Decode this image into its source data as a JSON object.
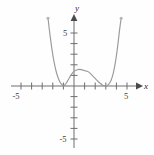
{
  "figure": {
    "background_color": "#fefefe",
    "axis_color": "#6e6e6e",
    "curve_color": "#9a9a9a",
    "label_color": "#3d3d3d"
  },
  "labels": {
    "x_axis_name": "x",
    "y_axis_name": "y",
    "x_neg_five": "-5",
    "x_pos_five": "5",
    "y_pos_five": "5",
    "y_neg_five": "-5"
  },
  "chart_data": {
    "type": "line",
    "title": "",
    "subtitle": "",
    "xlabel": "x",
    "ylabel": "y",
    "xlim": [
      -5.9,
      6.4
    ],
    "ylim": [
      -6.6,
      6.6
    ],
    "grid": false,
    "legend": null,
    "xticks": [
      -5,
      -4,
      -3,
      -2,
      -1,
      0,
      1,
      2,
      3,
      4,
      5
    ],
    "xtick_labels": [
      "-5",
      "",
      "",
      "",
      "",
      "",
      "",
      "",
      "",
      "",
      "5"
    ],
    "yticks": [
      -5,
      -4,
      -3,
      -2,
      -1,
      0,
      1,
      2,
      3,
      4,
      5
    ],
    "ytick_labels": [
      "-5",
      "",
      "",
      "",
      "",
      "",
      "",
      "",
      "",
      "",
      "5"
    ],
    "annotations": [
      {
        "text": "double root",
        "x": -1,
        "y": 0
      },
      {
        "text": "double root",
        "x": 3,
        "y": 0
      },
      {
        "text": "local maximum",
        "x": 1,
        "y": 1.5
      }
    ],
    "series": [
      {
        "name": "quartic",
        "description": "W-shaped quartic with double roots at x=-1 and x=3, local max near (1, 1.5)",
        "x": [
          -2.45,
          -2.3,
          -2.1,
          -1.9,
          -1.7,
          -1.5,
          -1.3,
          -1.15,
          -1.0,
          -0.85,
          -0.7,
          -0.5,
          -0.3,
          -0.1,
          0.1,
          0.3,
          0.5,
          0.7,
          0.9,
          1.0,
          1.1,
          1.3,
          1.5,
          1.7,
          1.9,
          2.1,
          2.3,
          2.5,
          2.7,
          2.85,
          3.0,
          3.15,
          3.3,
          3.5,
          3.7,
          3.9,
          4.1,
          4.3,
          4.45
        ],
        "y": [
          6.4,
          5.1,
          3.6,
          2.38,
          1.44,
          0.78,
          0.33,
          0.15,
          0.0,
          0.12,
          0.31,
          0.66,
          1.0,
          1.28,
          1.45,
          1.54,
          1.57,
          1.54,
          1.48,
          1.45,
          1.43,
          1.36,
          1.22,
          1.02,
          0.82,
          0.6,
          0.4,
          0.23,
          0.08,
          0.02,
          0.0,
          0.06,
          0.2,
          0.55,
          1.2,
          2.2,
          3.6,
          5.3,
          6.4
        ]
      }
    ]
  },
  "geometry": {
    "origin_px": [
      74,
      86
    ],
    "px_per_unit_x": 10.6,
    "px_per_unit_y": 10.6
  }
}
